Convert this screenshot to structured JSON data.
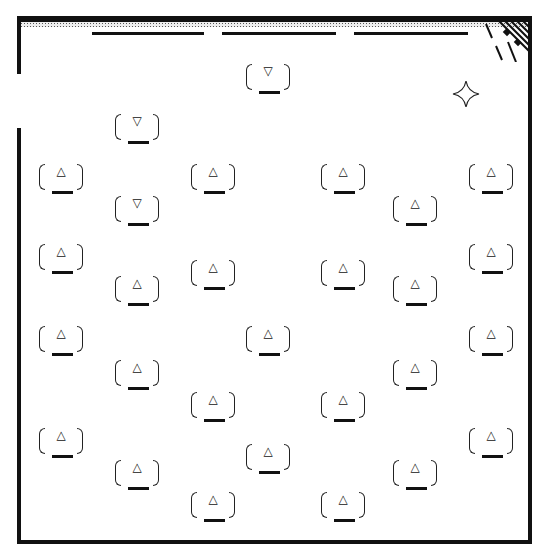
{
  "game": {
    "board": {
      "wall_color": "#111111",
      "background": "#ffffff"
    },
    "glyphs": {
      "up": "△",
      "down": "▽"
    },
    "pieces": [
      {
        "dir": "down",
        "glyph": "▽"
      },
      {
        "dir": "down",
        "glyph": "▽"
      },
      {
        "dir": "up",
        "glyph": "△"
      },
      {
        "dir": "up",
        "glyph": "△"
      },
      {
        "dir": "up",
        "glyph": "△"
      },
      {
        "dir": "up",
        "glyph": "△"
      },
      {
        "dir": "down",
        "glyph": "▽"
      },
      {
        "dir": "up",
        "glyph": "△"
      },
      {
        "dir": "up",
        "glyph": "△"
      },
      {
        "dir": "up",
        "glyph": "△"
      },
      {
        "dir": "up",
        "glyph": "△"
      },
      {
        "dir": "up",
        "glyph": "△"
      },
      {
        "dir": "up",
        "glyph": "△"
      },
      {
        "dir": "up",
        "glyph": "△"
      },
      {
        "dir": "up",
        "glyph": "△"
      },
      {
        "dir": "up",
        "glyph": "△"
      },
      {
        "dir": "up",
        "glyph": "△"
      },
      {
        "dir": "up",
        "glyph": "△"
      },
      {
        "dir": "up",
        "glyph": "△"
      },
      {
        "dir": "up",
        "glyph": "△"
      },
      {
        "dir": "up",
        "glyph": "△"
      },
      {
        "dir": "up",
        "glyph": "△"
      },
      {
        "dir": "up",
        "glyph": "△"
      },
      {
        "dir": "up",
        "glyph": "△"
      },
      {
        "dir": "up",
        "glyph": "△"
      },
      {
        "dir": "up",
        "glyph": "△"
      },
      {
        "dir": "up",
        "glyph": "△"
      },
      {
        "dir": "up",
        "glyph": "△"
      },
      {
        "dir": "up",
        "glyph": "△"
      },
      {
        "dir": "up",
        "glyph": "△"
      }
    ],
    "sparkle_icon": "four-point-star",
    "corner_icon": "hatched-corner"
  }
}
